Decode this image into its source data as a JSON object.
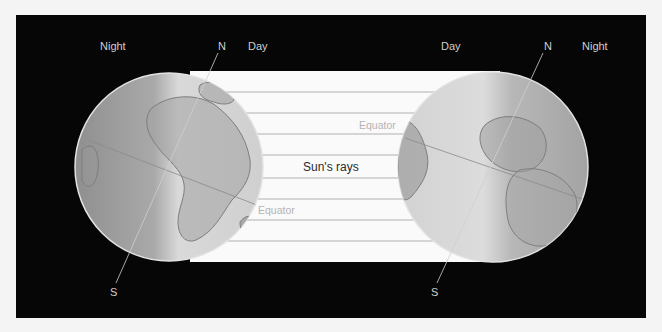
{
  "figure": {
    "background_color": "#060606",
    "page_color": "#f4f4f4",
    "rays_color": "#fafafa",
    "ray_line_color": "#c9c9c9",
    "globe_color": "#bdbdbd"
  },
  "left_globe": {
    "night_label": "Night",
    "day_label": "Day",
    "north_label": "N",
    "south_label": "S",
    "equator_label": "Equator"
  },
  "right_globe": {
    "night_label": "Night",
    "day_label": "Day",
    "north_label": "N",
    "south_label": "S",
    "equator_label": "Equator"
  },
  "sun_rays": {
    "label": "Sun's rays",
    "line_count": 9
  }
}
